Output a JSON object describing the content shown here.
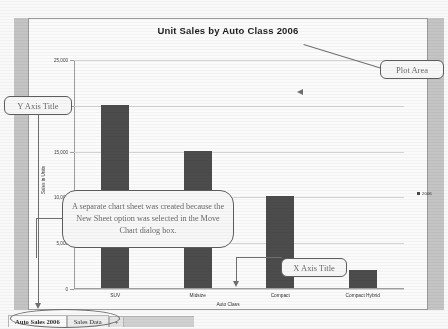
{
  "chart_data": {
    "type": "bar",
    "title": "Unit Sales by Auto Class 2006",
    "categories": [
      "SUV",
      "Midsize",
      "Compact",
      "Compact Hybrid"
    ],
    "values": [
      20000,
      15000,
      10000,
      2000
    ],
    "series": [
      {
        "name": "2006",
        "values": [
          20000,
          15000,
          10000,
          2000
        ]
      }
    ],
    "xlabel": "Auto Class",
    "ylabel": "Sales in Units",
    "ylim": [
      0,
      25000
    ],
    "ytick_labels": [
      "25,000",
      "20,000",
      "15,000",
      "10,000",
      "5,000",
      "0"
    ],
    "ytick_values": [
      25000,
      20000,
      15000,
      10000,
      5000,
      0
    ],
    "grid": true,
    "legend_position": "right",
    "bar_color": "#4a4a4a"
  },
  "annotations": {
    "plot_area": "Plot Area",
    "y_axis_title": "Y Axis Title",
    "x_axis_title": "X Axis Title",
    "note": "A separate chart sheet was created because the New Sheet option was selected in the Move Chart dialog box."
  },
  "tabs": {
    "items": [
      {
        "label": "Auto Sales 2006",
        "active": true
      },
      {
        "label": "Sales Data",
        "active": false
      }
    ],
    "add_label": "➕"
  },
  "colors": {
    "bar": "#4a4a4a",
    "gridline": "#d6d6d6",
    "axis": "#9f9f9f",
    "callout_border": "#5c5c5c",
    "margin": "#bcbcbc"
  }
}
